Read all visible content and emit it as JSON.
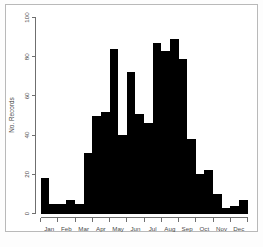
{
  "figure": {
    "background_color": "#ffffff",
    "frame_color": "#b9b9b9",
    "bar_color": "#000000",
    "axis_color": "#6f6f6f"
  },
  "axes": {
    "y_title": "No. Records",
    "y_ticks": [
      "0",
      "20",
      "40",
      "60",
      "80",
      "100"
    ],
    "x_ticks": [
      "Jan",
      "Feb",
      "Mar",
      "Apr",
      "May",
      "Jun",
      "Jul",
      "Aug",
      "Sep",
      "Oct",
      "Nov",
      "Dec"
    ]
  },
  "chart_data": {
    "type": "bar",
    "title": "",
    "xlabel": "",
    "ylabel": "No. Records",
    "ylim": [
      0,
      100
    ],
    "grid": false,
    "legend": null,
    "categories": [
      "Jan 1",
      "Jan 2",
      "Feb 1",
      "Feb 2",
      "Mar 1",
      "Mar 2",
      "Apr 1",
      "Apr 2",
      "May 1",
      "May 2",
      "Jun 1",
      "Jun 2",
      "Jul 1",
      "Jul 2",
      "Aug 1",
      "Aug 2",
      "Sep 1",
      "Sep 2",
      "Oct 1",
      "Oct 2",
      "Nov 1",
      "Nov 2",
      "Dec 1",
      "Dec 2"
    ],
    "values": [
      18,
      5,
      5,
      7,
      5,
      31,
      50,
      52,
      84,
      40,
      72,
      51,
      46,
      87,
      83,
      89,
      79,
      38,
      20,
      22,
      10,
      3,
      4,
      7
    ],
    "x_tick_labels": [
      "Jan",
      "Feb",
      "Mar",
      "Apr",
      "May",
      "Jun",
      "Jul",
      "Aug",
      "Sep",
      "Oct",
      "Nov",
      "Dec"
    ],
    "y_tick_values": [
      0,
      20,
      40,
      60,
      80,
      100
    ]
  }
}
